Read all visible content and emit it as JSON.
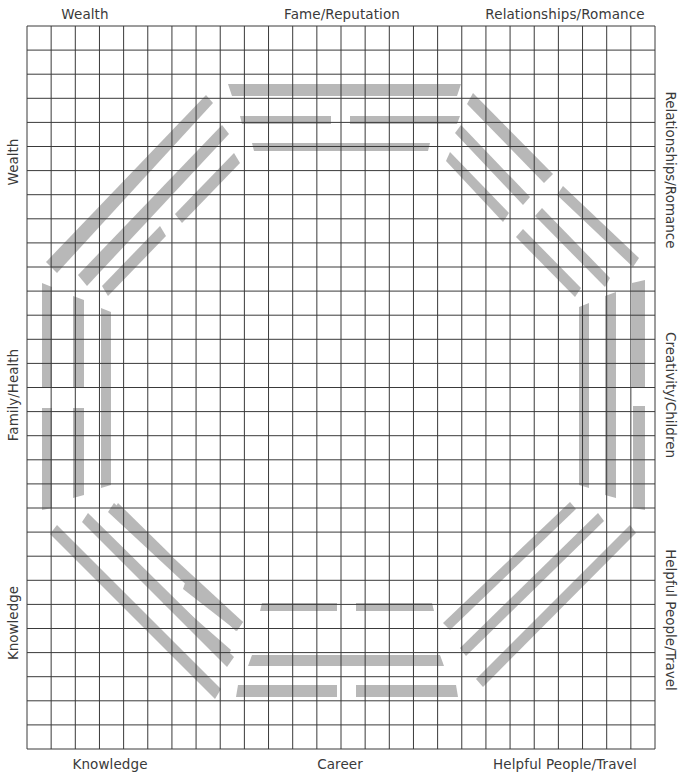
{
  "labels": {
    "top": [
      {
        "text": "Wealth",
        "x": 85
      },
      {
        "text": "Fame/Reputation",
        "x": 342
      },
      {
        "text": "Relationships/Romance",
        "x": 565
      }
    ],
    "bottom": [
      {
        "text": "Knowledge",
        "x": 110
      },
      {
        "text": "Career",
        "x": 340
      },
      {
        "text": "Helpful People/Travel",
        "x": 565
      }
    ],
    "left": [
      {
        "text": "Wealth",
        "y": 162
      },
      {
        "text": "Family/Health",
        "y": 395
      },
      {
        "text": "Knowledge",
        "y": 623
      }
    ],
    "right": [
      {
        "text": "Relationships/Romance",
        "y": 170
      },
      {
        "text": "Creativity/Children",
        "y": 395
      },
      {
        "text": "Helpful People/Travel",
        "y": 620
      }
    ]
  },
  "grid": {
    "left": 27,
    "top": 26,
    "right": 655,
    "bottom": 749,
    "cols": 26,
    "rows": 30,
    "line_color": "#3a3a3a",
    "bar_color": "#b8b8b8"
  },
  "trigrams": {
    "fame": [
      [
        [
          228,
          84
        ],
        [
          461,
          84
        ],
        [
          457,
          96
        ],
        [
          232,
          96
        ]
      ],
      [
        [
          240,
          116
        ],
        [
          331,
          116
        ],
        [
          331,
          124
        ],
        [
          242,
          124
        ]
      ],
      [
        [
          350,
          116
        ],
        [
          460,
          116
        ],
        [
          457,
          124
        ],
        [
          350,
          124
        ]
      ],
      [
        [
          252,
          143
        ],
        [
          430,
          143
        ],
        [
          428,
          151
        ],
        [
          254,
          151
        ]
      ]
    ],
    "career": [
      [
        [
          262,
          603
        ],
        [
          337,
          603
        ],
        [
          337,
          611
        ],
        [
          260,
          611
        ]
      ],
      [
        [
          356,
          603
        ],
        [
          432,
          603
        ],
        [
          434,
          611
        ],
        [
          356,
          611
        ]
      ],
      [
        [
          252,
          655
        ],
        [
          440,
          655
        ],
        [
          444,
          666
        ],
        [
          248,
          666
        ]
      ],
      [
        [
          238,
          685
        ],
        [
          337,
          685
        ],
        [
          337,
          697
        ],
        [
          236,
          697
        ]
      ],
      [
        [
          356,
          685
        ],
        [
          456,
          685
        ],
        [
          458,
          697
        ],
        [
          356,
          697
        ]
      ]
    ],
    "family": [
      [
        [
          42,
          283
        ],
        [
          52,
          287
        ],
        [
          52,
          388
        ],
        [
          42,
          388
        ]
      ],
      [
        [
          42,
          408
        ],
        [
          52,
          408
        ],
        [
          52,
          508
        ],
        [
          42,
          510
        ]
      ],
      [
        [
          73,
          296
        ],
        [
          84,
          300
        ],
        [
          84,
          388
        ],
        [
          73,
          388
        ]
      ],
      [
        [
          73,
          408
        ],
        [
          84,
          408
        ],
        [
          84,
          495
        ],
        [
          73,
          498
        ]
      ],
      [
        [
          101,
          308
        ],
        [
          111,
          312
        ],
        [
          111,
          485
        ],
        [
          101,
          488
        ]
      ]
    ],
    "creativity": [
      [
        [
          579,
          307
        ],
        [
          589,
          303
        ],
        [
          589,
          488
        ],
        [
          579,
          485
        ]
      ],
      [
        [
          605,
          296
        ],
        [
          616,
          292
        ],
        [
          616,
          498
        ],
        [
          605,
          495
        ]
      ],
      [
        [
          632,
          283
        ],
        [
          645,
          280
        ],
        [
          645,
          388
        ],
        [
          632,
          388
        ]
      ],
      [
        [
          633,
          406
        ],
        [
          645,
          406
        ],
        [
          645,
          510
        ],
        [
          633,
          508
        ]
      ]
    ],
    "wealth": [
      [
        [
          46,
          262
        ],
        [
          206,
          95
        ],
        [
          213,
          103
        ],
        [
          57,
          273
        ]
      ],
      [
        [
          78,
          275
        ],
        [
          222,
          125
        ],
        [
          229,
          134
        ],
        [
          87,
          286
        ]
      ],
      [
        [
          175,
          214
        ],
        [
          234,
          153
        ],
        [
          240,
          163
        ],
        [
          182,
          223
        ]
      ],
      [
        [
          102,
          286
        ],
        [
          160,
          226
        ],
        [
          166,
          236
        ],
        [
          108,
          296
        ]
      ]
    ],
    "relationships": [
      [
        [
          473,
          93
        ],
        [
          553,
          174
        ],
        [
          544,
          183
        ],
        [
          467,
          104
        ]
      ],
      [
        [
          461,
          125
        ],
        [
          530,
          197
        ],
        [
          523,
          205
        ],
        [
          455,
          133
        ]
      ],
      [
        [
          450,
          152
        ],
        [
          509,
          213
        ],
        [
          503,
          222
        ],
        [
          446,
          161
        ]
      ],
      [
        [
          563,
          186
        ],
        [
          639,
          258
        ],
        [
          633,
          267
        ],
        [
          557,
          195
        ]
      ],
      [
        [
          542,
          208
        ],
        [
          610,
          278
        ],
        [
          605,
          287
        ],
        [
          535,
          216
        ]
      ],
      [
        [
          523,
          229
        ],
        [
          581,
          288
        ],
        [
          575,
          297
        ],
        [
          516,
          237
        ]
      ]
    ],
    "knowledge": [
      [
        [
          57,
          525
        ],
        [
          221,
          689
        ],
        [
          215,
          699
        ],
        [
          50,
          534
        ]
      ],
      [
        [
          88,
          513
        ],
        [
          234,
          657
        ],
        [
          227,
          667
        ],
        [
          82,
          522
        ]
      ],
      [
        [
          114,
          503
        ],
        [
          243,
          622
        ],
        [
          236,
          631
        ],
        [
          108,
          512
        ]
      ],
      [
        [
          118,
          503
        ],
        [
          173,
          557
        ],
        [
          168,
          566
        ],
        [
          113,
          512
        ]
      ],
      [
        [
          186,
          580
        ],
        [
          243,
          622
        ],
        [
          237,
          631
        ],
        [
          183,
          589
        ]
      ],
      [
        [
          167,
          594
        ],
        [
          231,
          650
        ],
        [
          226,
          659
        ],
        [
          163,
          603
        ]
      ]
    ],
    "helpful": [
      [
        [
          570,
          502
        ],
        [
          576,
          509
        ],
        [
          450,
          630
        ],
        [
          443,
          623
        ]
      ],
      [
        [
          598,
          513
        ],
        [
          604,
          521
        ],
        [
          466,
          656
        ],
        [
          460,
          648
        ]
      ],
      [
        [
          630,
          525
        ],
        [
          636,
          533
        ],
        [
          483,
          687
        ],
        [
          476,
          679
        ]
      ]
    ]
  }
}
